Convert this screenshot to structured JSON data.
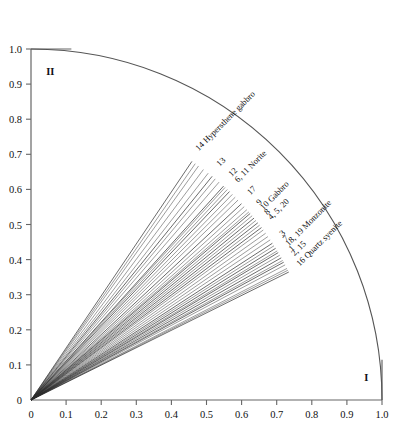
{
  "chart_data": {
    "type": "line",
    "title": "",
    "xlabel": "I",
    "ylabel": "II",
    "xlim": [
      0,
      1.0
    ],
    "ylim": [
      0,
      1.0
    ],
    "grid": false,
    "legend_position": "none",
    "xticks": [
      "0",
      "0.1",
      "0.2",
      "0.3",
      "0.4",
      "0.5",
      "0.6",
      "0.7",
      "0.8",
      "0.9",
      "1.0"
    ],
    "yticks": [
      "0",
      "0.1",
      "0.2",
      "0.3",
      "0.4",
      "0.5",
      "0.6",
      "0.7",
      "0.8",
      "0.9",
      "1.0"
    ],
    "arc": {
      "type": "quarter-circle",
      "radius": 1.0,
      "center": [
        0,
        0
      ]
    },
    "rays": [
      {
        "label": "14 Hypersthene gabbro",
        "angle_deg": 56.0,
        "radius": 0.82
      },
      {
        "label": "13",
        "angle_deg": 51.0,
        "radius": 0.82
      },
      {
        "label": "12",
        "angle_deg": 48.0,
        "radius": 0.82
      },
      {
        "label": "6, 11 Norite",
        "angle_deg": 46.4,
        "radius": 0.82
      },
      {
        "label": "17",
        "angle_deg": 43.0,
        "radius": 0.82
      },
      {
        "label": "9",
        "angle_deg": 40.4,
        "radius": 0.82
      },
      {
        "label": "10 Gabbro",
        "angle_deg": 39.2,
        "radius": 0.82
      },
      {
        "label": "8",
        "angle_deg": 38.0,
        "radius": 0.82
      },
      {
        "label": "4, 5, 20",
        "angle_deg": 36.8,
        "radius": 0.82
      },
      {
        "label": "3",
        "angle_deg": 33.0,
        "radius": 0.82
      },
      {
        "label": "7",
        "angle_deg": 31.8,
        "radius": 0.82
      },
      {
        "label": "18, 19 Monzonite",
        "angle_deg": 30.8,
        "radius": 0.82
      },
      {
        "label": "1",
        "angle_deg": 29.6,
        "radius": 0.82
      },
      {
        "label": "2, 15",
        "angle_deg": 28.6,
        "radius": 0.82
      },
      {
        "label": "16 Quartz syenite",
        "angle_deg": 26.4,
        "radius": 0.82
      }
    ],
    "extra_rays_deg": [
      55.2,
      54.4,
      53.2,
      52.0,
      50.2,
      49.2,
      47.6,
      47.0,
      45.6,
      44.8,
      44.0,
      42.2,
      41.4,
      40.8,
      39.8,
      38.6,
      37.4,
      36.2,
      35.4,
      34.6,
      33.8,
      32.4,
      31.2,
      30.2,
      29.0,
      28.0,
      27.2,
      26.8
    ]
  },
  "axes": {
    "x_axis_name": "I",
    "y_axis_name": "II"
  },
  "colors": {
    "line": "#2b2b2b",
    "arc": "#555555",
    "axis": "#666666",
    "text": "#111111",
    "background": "#ffffff"
  }
}
